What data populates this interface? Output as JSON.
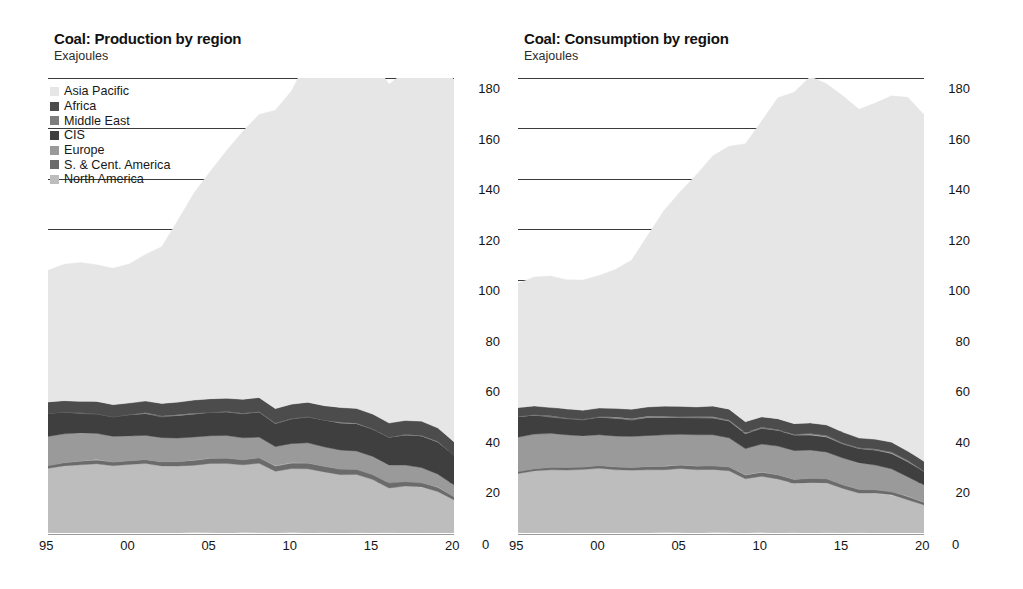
{
  "figure": {
    "units_label": "Exajoules",
    "y_axis": {
      "ticks": [
        0,
        20,
        40,
        60,
        80,
        100,
        120,
        140,
        160,
        180
      ],
      "min": 0,
      "max": 180,
      "zero_label": "0"
    },
    "x_axis": {
      "tick_labels": [
        "95",
        "00",
        "05",
        "10",
        "15",
        "20"
      ],
      "tick_years": [
        1995,
        2000,
        2005,
        2010,
        2015,
        2020
      ],
      "min": 1995,
      "max": 2020
    },
    "legend": {
      "items": [
        {
          "label": "Asia Pacific",
          "color": "#e6e6e6"
        },
        {
          "label": "Africa",
          "color": "#4c4c4c"
        },
        {
          "label": "Middle East",
          "color": "#7d7d7d"
        },
        {
          "label": "CIS",
          "color": "#3f3f3f"
        },
        {
          "label": "Europe",
          "color": "#9a9a9a"
        },
        {
          "label": "S. & Cent. America",
          "color": "#6b6b6b"
        },
        {
          "label": "North America",
          "color": "#bdbdbd"
        }
      ]
    }
  },
  "chart_data": [
    {
      "type": "area",
      "stacked": true,
      "title": "Coal: Production by region",
      "subtitle": "Exajoules",
      "xlabel": "",
      "ylabel": "Exajoules",
      "ylim": [
        0,
        180
      ],
      "xlim": [
        1995,
        2020
      ],
      "grid": true,
      "legend_position": "top-left",
      "x": [
        1995,
        1996,
        1997,
        1998,
        1999,
        2000,
        2001,
        2002,
        2003,
        2004,
        2005,
        2006,
        2007,
        2008,
        2009,
        2010,
        2011,
        2012,
        2013,
        2014,
        2015,
        2016,
        2017,
        2018,
        2019,
        2020
      ],
      "stack_order_bottom_to_top": [
        "North America",
        "S. & Cent. America",
        "Europe",
        "CIS",
        "Middle East",
        "Africa",
        "Asia Pacific"
      ],
      "series": [
        {
          "name": "North America",
          "color": "#bdbdbd",
          "values": [
            25.5,
            26.5,
            27.0,
            27.5,
            26.5,
            27.0,
            27.5,
            26.5,
            26.5,
            27.0,
            27.5,
            27.5,
            27.0,
            27.5,
            24.5,
            25.5,
            25.5,
            24.0,
            23.0,
            23.0,
            21.0,
            18.0,
            18.5,
            18.0,
            16.5,
            13.0
          ]
        },
        {
          "name": "S. & Cent. America",
          "color": "#6b6b6b",
          "values": [
            1.2,
            1.3,
            1.4,
            1.4,
            1.5,
            1.5,
            1.5,
            1.6,
            1.7,
            1.8,
            1.9,
            2.0,
            2.0,
            2.1,
            2.0,
            2.1,
            2.2,
            2.2,
            2.2,
            2.1,
            2.0,
            1.9,
            1.9,
            1.8,
            1.6,
            1.2
          ]
        },
        {
          "name": "Europe",
          "color": "#9a9a9a",
          "values": [
            11.5,
            11.5,
            11.0,
            10.5,
            10.0,
            9.8,
            9.8,
            9.5,
            9.5,
            9.3,
            9.0,
            9.0,
            8.8,
            8.5,
            7.8,
            7.8,
            8.0,
            8.0,
            7.8,
            7.5,
            7.2,
            6.8,
            6.6,
            6.2,
            5.4,
            4.6
          ]
        },
        {
          "name": "CIS",
          "color": "#3f3f3f",
          "values": [
            9.0,
            8.5,
            8.0,
            7.8,
            8.0,
            8.3,
            8.5,
            8.5,
            8.8,
            9.0,
            9.2,
            9.3,
            9.5,
            9.8,
            9.0,
            9.8,
            10.2,
            10.5,
            10.6,
            10.6,
            10.8,
            11.0,
            11.8,
            12.4,
            12.5,
            11.8
          ]
        },
        {
          "name": "Middle East",
          "color": "#7d7d7d",
          "values": [
            0.1,
            0.1,
            0.1,
            0.1,
            0.1,
            0.1,
            0.1,
            0.1,
            0.1,
            0.1,
            0.1,
            0.1,
            0.1,
            0.1,
            0.1,
            0.1,
            0.1,
            0.1,
            0.1,
            0.1,
            0.1,
            0.1,
            0.1,
            0.1,
            0.1,
            0.1
          ]
        },
        {
          "name": "Africa",
          "color": "#4c4c4c",
          "values": [
            4.5,
            4.6,
            4.7,
            4.7,
            4.8,
            4.8,
            4.9,
            5.0,
            5.2,
            5.3,
            5.3,
            5.3,
            5.4,
            5.6,
            5.7,
            5.7,
            5.6,
            5.6,
            5.8,
            5.9,
            5.8,
            5.8,
            5.7,
            5.7,
            5.6,
            5.3
          ]
        },
        {
          "name": "Asia Pacific",
          "color": "#e6e6e6",
          "values": [
            52.0,
            54.0,
            55.0,
            54.0,
            54.0,
            55.0,
            58.0,
            62.0,
            72.0,
            82.0,
            90.0,
            98.0,
            106.0,
            112.0,
            118.0,
            124.0,
            136.0,
            142.0,
            146.0,
            144.0,
            140.0,
            134.0,
            138.0,
            143.0,
            147.0,
            143.0
          ]
        }
      ],
      "totals": [
        103.8,
        106.5,
        107.2,
        106.0,
        104.9,
        106.5,
        110.3,
        113.2,
        123.8,
        134.5,
        143.0,
        151.2,
        158.8,
        165.6,
        167.1,
        175.0,
        187.6,
        192.4,
        196.3,
        193.7,
        187.0,
        177.6,
        182.6,
        187.2,
        188.7,
        179.0
      ]
    },
    {
      "type": "area",
      "stacked": true,
      "title": "Coal: Consumption by region",
      "subtitle": "Exajoules",
      "xlabel": "",
      "ylabel": "Exajoules",
      "ylim": [
        0,
        180
      ],
      "xlim": [
        1995,
        2020
      ],
      "grid": true,
      "legend_position": "none",
      "x": [
        1995,
        1996,
        1997,
        1998,
        1999,
        2000,
        2001,
        2002,
        2003,
        2004,
        2005,
        2006,
        2007,
        2008,
        2009,
        2010,
        2011,
        2012,
        2013,
        2014,
        2015,
        2016,
        2017,
        2018,
        2019,
        2020
      ],
      "stack_order_bottom_to_top": [
        "North America",
        "S. & Cent. America",
        "Europe",
        "CIS",
        "Middle East",
        "Africa",
        "Asia Pacific"
      ],
      "series": [
        {
          "name": "North America",
          "color": "#bdbdbd",
          "values": [
            23.5,
            24.5,
            25.0,
            25.0,
            25.0,
            25.5,
            25.0,
            24.8,
            25.0,
            25.2,
            25.5,
            25.0,
            25.2,
            24.5,
            21.5,
            22.5,
            21.5,
            19.5,
            20.0,
            19.8,
            17.5,
            16.0,
            15.8,
            15.0,
            13.2,
            11.0
          ]
        },
        {
          "name": "S. & Cent. America",
          "color": "#6b6b6b",
          "values": [
            0.9,
            0.9,
            1.0,
            1.0,
            1.0,
            1.1,
            1.1,
            1.1,
            1.2,
            1.3,
            1.3,
            1.4,
            1.4,
            1.5,
            1.4,
            1.5,
            1.5,
            1.5,
            1.6,
            1.6,
            1.5,
            1.4,
            1.4,
            1.3,
            1.2,
            1.0
          ]
        },
        {
          "name": "Europe",
          "color": "#9a9a9a",
          "values": [
            13.5,
            13.8,
            13.2,
            12.8,
            12.2,
            12.2,
            12.4,
            12.2,
            12.5,
            12.4,
            12.2,
            12.4,
            12.4,
            11.8,
            10.6,
            11.2,
            11.4,
            11.8,
            11.4,
            10.8,
            10.6,
            10.2,
            9.8,
            9.2,
            8.0,
            6.8
          ]
        },
        {
          "name": "CIS",
          "color": "#3f3f3f",
          "values": [
            8.0,
            7.4,
            6.8,
            6.5,
            6.6,
            6.8,
            6.9,
            6.7,
            7.0,
            6.8,
            6.6,
            6.6,
            6.6,
            6.6,
            5.8,
            6.2,
            6.2,
            6.0,
            5.8,
            5.8,
            5.6,
            5.6,
            5.8,
            6.0,
            5.8,
            5.4
          ]
        },
        {
          "name": "Middle East",
          "color": "#7d7d7d",
          "values": [
            0.3,
            0.3,
            0.3,
            0.3,
            0.3,
            0.3,
            0.3,
            0.3,
            0.3,
            0.4,
            0.4,
            0.4,
            0.4,
            0.4,
            0.4,
            0.4,
            0.4,
            0.4,
            0.4,
            0.4,
            0.4,
            0.4,
            0.4,
            0.4,
            0.4,
            0.4
          ]
        },
        {
          "name": "Africa",
          "color": "#4c4c4c",
          "values": [
            3.4,
            3.5,
            3.5,
            3.5,
            3.6,
            3.6,
            3.7,
            3.8,
            3.9,
            4.0,
            4.0,
            4.0,
            4.1,
            4.2,
            4.2,
            4.2,
            4.1,
            4.1,
            4.2,
            4.3,
            4.2,
            4.1,
            4.0,
            4.0,
            3.9,
            3.7
          ]
        },
        {
          "name": "Asia Pacific",
          "color": "#e6e6e6",
          "values": [
            49.0,
            51.0,
            52.0,
            51.0,
            51.5,
            52.5,
            55.0,
            59.0,
            68.0,
            77.5,
            85.0,
            92.0,
            99.0,
            104.0,
            110.0,
            117.0,
            127.0,
            131.0,
            137.0,
            135.0,
            133.0,
            130.0,
            133.0,
            137.0,
            140.0,
            137.0
          ]
        }
      ],
      "totals": [
        98.6,
        101.4,
        101.8,
        100.1,
        100.2,
        102.0,
        104.4,
        107.9,
        117.9,
        127.6,
        135.0,
        141.8,
        149.1,
        153.0,
        153.9,
        163.0,
        172.1,
        174.3,
        180.4,
        177.7,
        172.8,
        167.7,
        170.2,
        172.9,
        172.5,
        165.3
      ]
    }
  ]
}
